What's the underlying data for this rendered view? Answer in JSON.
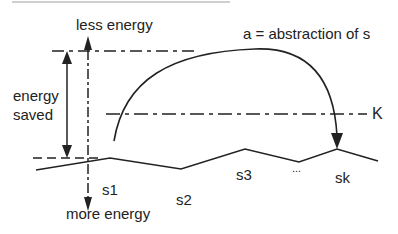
{
  "diagram": {
    "type": "energy-landscape-abstraction",
    "labels": {
      "less_energy": "less energy",
      "more_energy": "more energy",
      "energy_saved_line1": "energy",
      "energy_saved_line2": "saved",
      "abstraction": "a = abstraction of s",
      "threshold": "K",
      "states": [
        "s1",
        "s2",
        "s3",
        "...",
        "sk"
      ]
    },
    "colors": {
      "ink": "#222222",
      "top_rule": "#cccccc",
      "background": "#ffffff"
    }
  }
}
